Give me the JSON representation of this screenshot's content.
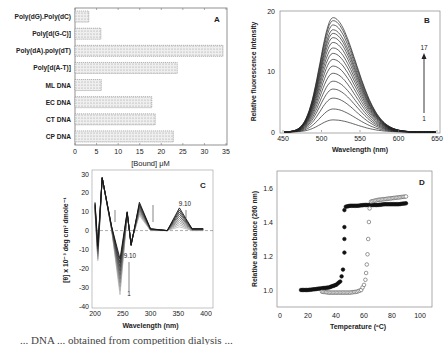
{
  "chart_data": [
    {
      "panel": "A",
      "type": "bar",
      "orientation": "horizontal",
      "categories": [
        "Poly(dG).Poly(dC)",
        "Poly[d(G-C)]",
        "Poly(dA).poly(dT)",
        "Poly[d(A-T)]",
        "ML DNA",
        "EC DNA",
        "CT DNA",
        "CP DNA"
      ],
      "values": [
        3.2,
        6.0,
        34.3,
        23.7,
        6.1,
        17.8,
        18.6,
        22.8
      ],
      "xlabel": "[Bound] μM",
      "ylabel": "",
      "xlim": [
        0,
        35
      ],
      "xticks": [
        0,
        5,
        10,
        15,
        20,
        25,
        30,
        35
      ],
      "panel_label": "A",
      "bar_fill": "hatched light gray"
    },
    {
      "panel": "B",
      "type": "line",
      "xlabel": "Wavelength (nm)",
      "ylabel": "Relative fluorescence intensity",
      "xlim": [
        450,
        650
      ],
      "ylim": [
        0,
        20
      ],
      "xticks": [
        450,
        500,
        550,
        600,
        650
      ],
      "yticks": [
        0,
        10,
        20
      ],
      "panel_label": "B",
      "annotation": {
        "arrow_from": "1",
        "arrow_to": "17"
      },
      "peak_wavelength": 515,
      "series_peaks": [
        2.0,
        3.8,
        5.6,
        7.1,
        8.4,
        9.7,
        10.9,
        12.0,
        13.0,
        13.9,
        14.8,
        15.6,
        16.3,
        16.9,
        17.7,
        18.4,
        18.9
      ]
    },
    {
      "panel": "C",
      "type": "line",
      "xlabel": "Wavelength (nm)",
      "ylabel": "[θ] x 10⁻³ deg cm² dmole⁻¹",
      "xlim": [
        200,
        400
      ],
      "ylim": [
        -40,
        30
      ],
      "xticks": [
        200,
        250,
        300,
        350,
        400
      ],
      "yticks": [
        -40,
        -30,
        -20,
        -10,
        0,
        10,
        20,
        30
      ],
      "panel_label": "C",
      "annotations": [
        "9.10",
        "9.10",
        "1"
      ],
      "series_count": 10,
      "key_points": {
        "x": [
          200,
          205,
          213,
          230,
          245,
          258,
          265,
          280,
          300,
          330,
          352,
          375,
          395
        ],
        "y_first": [
          10,
          -16,
          28,
          0,
          -34,
          8,
          -6,
          8,
          0,
          0,
          2,
          0,
          0
        ],
        "y_last": [
          15,
          -8,
          28,
          2,
          -15,
          10,
          -8,
          15,
          1,
          0,
          12,
          1,
          1
        ]
      }
    },
    {
      "panel": "D",
      "type": "scatter",
      "xlabel": "Temperature (ºC)",
      "ylabel": "Relative absorbance (260 nm)",
      "xlim": [
        0,
        100
      ],
      "ylim": [
        0.9,
        1.7
      ],
      "xticks": [
        0,
        20,
        40,
        60,
        80,
        100
      ],
      "yticks": [
        1.0,
        1.2,
        1.4,
        1.6
      ],
      "panel_label": "D",
      "series": [
        {
          "name": "filled",
          "marker": "filled-circle",
          "x": [
            15,
            20,
            25,
            30,
            35,
            40,
            43,
            44,
            45,
            46,
            46,
            46,
            46,
            47,
            50,
            55,
            60,
            65,
            70,
            75,
            80,
            85,
            90
          ],
          "y": [
            1.0,
            1.0,
            1.005,
            1.01,
            1.015,
            1.03,
            1.05,
            1.08,
            1.12,
            1.22,
            1.3,
            1.37,
            1.47,
            1.49,
            1.495,
            1.495,
            1.5,
            1.5,
            1.5,
            1.505,
            1.505,
            1.505,
            1.51
          ]
        },
        {
          "name": "open",
          "marker": "open-circle",
          "x": [
            30,
            35,
            40,
            45,
            50,
            55,
            58,
            60,
            61,
            61.5,
            62,
            62.5,
            63,
            63.5,
            64,
            65,
            70,
            75,
            80,
            85,
            90
          ],
          "y": [
            0.99,
            0.985,
            0.985,
            0.985,
            0.985,
            0.99,
            1.0,
            1.03,
            1.06,
            1.1,
            1.15,
            1.21,
            1.3,
            1.4,
            1.48,
            1.52,
            1.53,
            1.535,
            1.54,
            1.545,
            1.55
          ]
        }
      ]
    }
  ],
  "caption_fragment": "... DNA ... obtained from competition dialysis ..."
}
